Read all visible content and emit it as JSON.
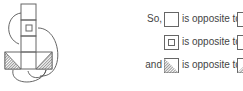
{
  "net": {
    "description": "cube net with arrows linking opposite faces"
  },
  "statements": [
    {
      "prefix": "So,",
      "face_a": "blank",
      "text": "is opposite to",
      "face_b": "blank"
    },
    {
      "prefix": "",
      "face_a": "small-square",
      "text": "is opposite to",
      "face_b": "blank"
    },
    {
      "prefix": "and",
      "face_a": "hatched-left",
      "text": "is opposite to",
      "face_b": "hatched-right"
    }
  ],
  "colors": {
    "line": "#666666",
    "text": "#444444"
  }
}
